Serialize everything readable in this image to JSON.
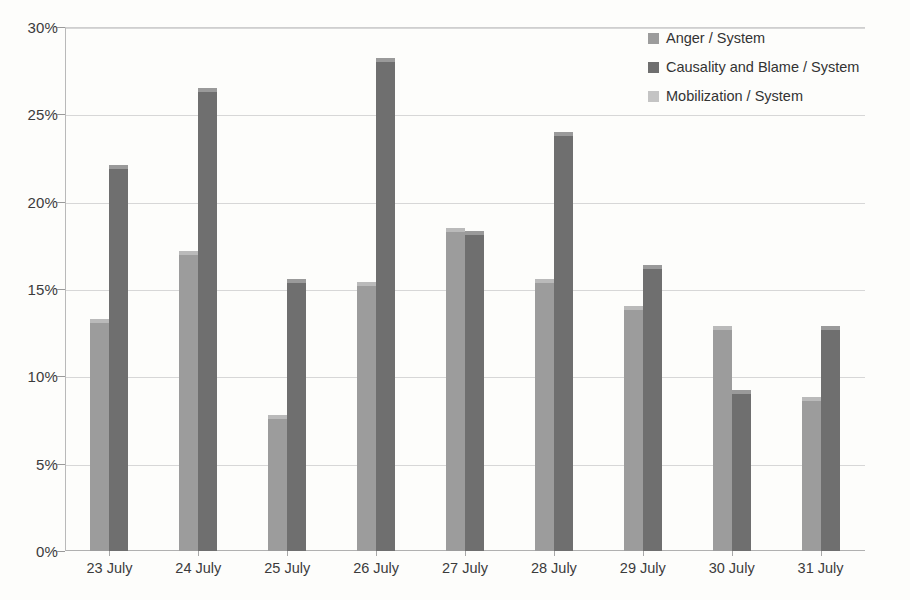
{
  "chart_data": {
    "type": "bar",
    "title": "",
    "subtitle": "",
    "xlabel": "",
    "ylabel": "",
    "categories": [
      "23 July",
      "24 July",
      "25 July",
      "26 July",
      "27 July",
      "28 July",
      "29 July",
      "30 July",
      "31 July"
    ],
    "series": [
      {
        "name": "Anger / System",
        "color": "#9c9c9c",
        "values": [
          13.3,
          17.2,
          7.8,
          15.4,
          18.5,
          15.6,
          14.0,
          12.9,
          8.8
        ]
      },
      {
        "name": "Causality and Blame / System",
        "color": "#6f6f6f",
        "values": [
          22.1,
          26.5,
          15.6,
          28.2,
          18.3,
          24.0,
          16.4,
          9.2,
          12.9
        ]
      },
      {
        "name": "Mobilization / System",
        "color": "#c4c4c4",
        "values": [
          0,
          0,
          0,
          0,
          0,
          0,
          0,
          0,
          0
        ]
      }
    ],
    "ylim": [
      0,
      30
    ],
    "ytick_values": [
      0,
      5,
      10,
      15,
      20,
      25,
      30
    ],
    "ytick_labels": [
      "0%",
      "5%",
      "10%",
      "15%",
      "20%",
      "25%",
      "30%"
    ],
    "grid": true,
    "legend_position": "top-right",
    "value_format": "percent"
  }
}
